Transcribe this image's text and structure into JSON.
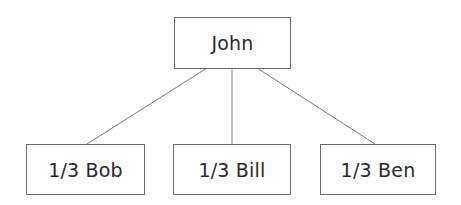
{
  "diagram": {
    "type": "tree",
    "root": {
      "label": "John"
    },
    "children": [
      {
        "label": "1/3 Bob"
      },
      {
        "label": "1/3 Bill"
      },
      {
        "label": "1/3 Ben"
      }
    ],
    "colors": {
      "line": "#6b6b6b",
      "text": "#2a2a2a",
      "box_border": "#6b6b6b"
    }
  }
}
